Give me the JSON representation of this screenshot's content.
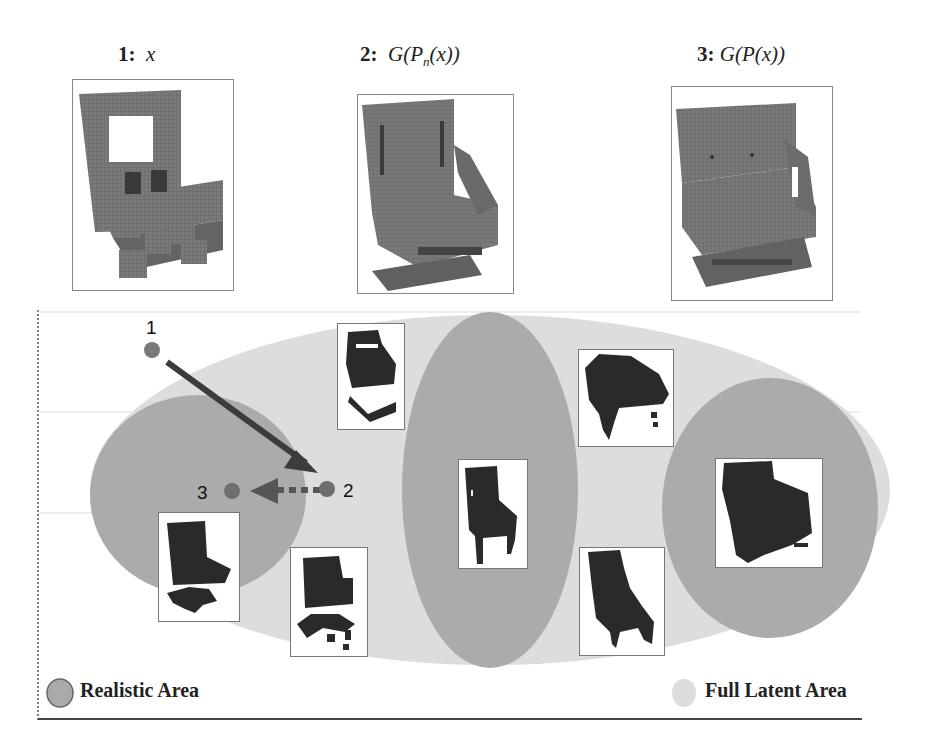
{
  "figure": {
    "panels": [
      {
        "index_label": "1:",
        "formula_label": "x",
        "subject": "input voxel chair"
      },
      {
        "index_label": "2:",
        "formula_pre": "G(P",
        "formula_sub": "n",
        "formula_post": "(x))",
        "subject": "chair after projection with noise"
      },
      {
        "index_label": "3:",
        "formula_label": "G(P(x))",
        "subject": "chair after projection"
      }
    ],
    "latent_points": [
      {
        "label": "1"
      },
      {
        "label": "2"
      },
      {
        "label": "3"
      }
    ],
    "arrows": [
      {
        "from": "1",
        "to": "2",
        "style": "solid"
      },
      {
        "from": "2",
        "to": "3",
        "style": "dotted"
      }
    ],
    "regions": {
      "full_latent": {
        "name": "Full Latent Area",
        "color": "#dcdcdc"
      },
      "realistic": {
        "name": "Realistic Area",
        "color": "#aaaaaa"
      }
    },
    "legend": {
      "realistic_label": "Realistic Area",
      "full_latent_label": "Full Latent Area"
    },
    "sample_thumbnails": [
      {
        "subject": "broken chair, top-middle"
      },
      {
        "subject": "office chair, left realistic region"
      },
      {
        "subject": "noisy office chair, lower middle-left"
      },
      {
        "subject": "wooden side chair, center realistic region"
      },
      {
        "subject": "noisy armchair, top right"
      },
      {
        "subject": "noisy lounge chair, lower right"
      },
      {
        "subject": "sofa chair, right realistic region"
      }
    ],
    "colors": {
      "point": "#7a7a7a",
      "arrow": "#3c3c3c",
      "chair": "#2a2a2a",
      "voxel_chair": "#6e6e6e"
    }
  }
}
